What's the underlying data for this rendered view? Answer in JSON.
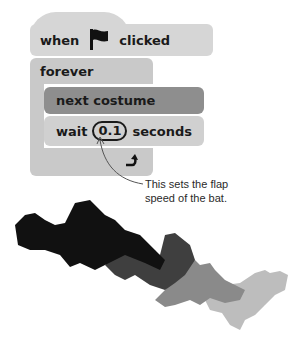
{
  "script": {
    "hat_block": {
      "prefix": "when",
      "icon": "green-flag-icon",
      "suffix": "clicked"
    },
    "forever_block": {
      "label": "forever"
    },
    "next_costume_block": {
      "label": "next costume"
    },
    "wait_block": {
      "prefix": "wait",
      "value": "0.1",
      "suffix": "seconds"
    },
    "loop_icon": "loop-arrow-icon"
  },
  "annotation": {
    "line1": "This sets the flap",
    "line2": "speed of the bat."
  },
  "illustration": {
    "description": "four overlapping bat costumes",
    "colors": [
      "#111111",
      "#3f3f3f",
      "#8a8a8a",
      "#bdbdbd"
    ]
  }
}
